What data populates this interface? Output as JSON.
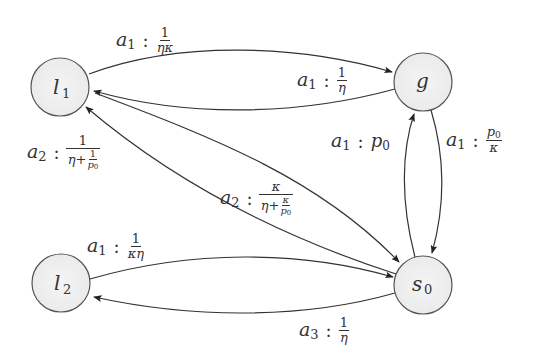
{
  "diagram": {
    "type": "state-transition-graph",
    "nodes": [
      {
        "id": "l1",
        "base": "l",
        "sub": "1",
        "cx": 60,
        "cy": 87,
        "r": 29
      },
      {
        "id": "g",
        "base": "g",
        "sub": "",
        "cx": 423,
        "cy": 82,
        "r": 29
      },
      {
        "id": "l2",
        "base": "l",
        "sub": "2",
        "cx": 61,
        "cy": 283,
        "r": 29
      },
      {
        "id": "s0",
        "base": "s",
        "sub": "0",
        "cx": 423,
        "cy": 285,
        "r": 29
      }
    ],
    "edges": [
      {
        "from": "l1",
        "to": "g",
        "action": "a1",
        "rate": "1/(ηκ)"
      },
      {
        "from": "g",
        "to": "l1",
        "action": "a1",
        "rate": "1/η"
      },
      {
        "from": "s0",
        "to": "l1",
        "action": "a2",
        "rate": "1/(η+1/p0)"
      },
      {
        "from": "l1",
        "to": "s0",
        "action": "a2",
        "rate": "κ/(η+κ/p0)"
      },
      {
        "from": "s0",
        "to": "g",
        "action": "a1",
        "rate": "p0"
      },
      {
        "from": "g",
        "to": "s0",
        "action": "a1",
        "rate": "p0/κ"
      },
      {
        "from": "l2",
        "to": "s0",
        "action": "a1",
        "rate": "1/(κη)"
      },
      {
        "from": "s0",
        "to": "l2",
        "action": "a3",
        "rate": "1/η"
      }
    ],
    "colors": {
      "node_fill": "#efefef",
      "node_stroke": "#555555",
      "edge_stroke": "#333333",
      "text": "#333333"
    }
  },
  "labels": {
    "l1_g": {
      "act": "a",
      "act_sub": "1",
      "colon": ":",
      "num": "1",
      "den": "ηκ"
    },
    "g_l1": {
      "act": "a",
      "act_sub": "1",
      "colon": ":",
      "num": "1",
      "den": "η"
    },
    "s0_l1": {
      "act": "a",
      "act_sub": "2",
      "colon": ":",
      "num": "1",
      "den_main": "η+",
      "den_frac_num": "1",
      "den_frac_den": "p",
      "den_frac_den_sub": "0"
    },
    "l1_s0": {
      "act": "a",
      "act_sub": "2",
      "colon": ":",
      "num": "κ",
      "den_main": "η+",
      "den_frac_num": "κ",
      "den_frac_den": "p",
      "den_frac_den_sub": "0"
    },
    "s0_g": {
      "act": "a",
      "act_sub": "1",
      "colon": ":",
      "val": "p",
      "val_sub": "0"
    },
    "g_s0": {
      "act": "a",
      "act_sub": "1",
      "colon": ":",
      "num": "p",
      "num_sub": "0",
      "den": "κ"
    },
    "l2_s0": {
      "act": "a",
      "act_sub": "1",
      "colon": ":",
      "num": "1",
      "den": "κη"
    },
    "s0_l2": {
      "act": "a",
      "act_sub": "3",
      "colon": ":",
      "num": "1",
      "den": "η"
    }
  },
  "node_text": {
    "l1": {
      "base": "l",
      "sub": "1"
    },
    "g": {
      "base": "g"
    },
    "l2": {
      "base": "l",
      "sub": "2"
    },
    "s0": {
      "base": "s",
      "sub": "0"
    }
  }
}
